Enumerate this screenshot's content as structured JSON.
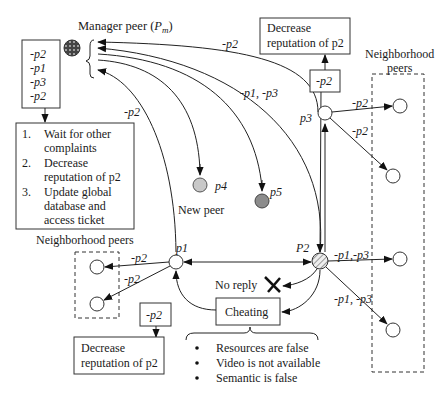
{
  "manager": {
    "label": "Manager peer (",
    "symbol": "P",
    "subscript": "m",
    "close": ")"
  },
  "complaint_queue": {
    "items": [
      "-p2",
      "-p1",
      "-p3",
      "-p2"
    ]
  },
  "manager_actions": {
    "items": [
      {
        "num": "1.",
        "lines": [
          "Wait for other",
          "complaints"
        ]
      },
      {
        "num": "2.",
        "lines": [
          "Decrease",
          "reputation of p2"
        ]
      },
      {
        "num": "3.",
        "lines": [
          "Update global",
          "database and",
          "access ticket"
        ]
      }
    ]
  },
  "edge_labels": {
    "p3_to_manager": "-p2",
    "p2_to_manager": "-p1, -p3",
    "p1_to_manager": "-p2",
    "p3_box": "-p2",
    "p3_n1": "-p2",
    "p3_n2": "-p2",
    "p2_n3": "-p1,-p3",
    "p2_n4": "-p1, -p3",
    "p1_n1": "-p2",
    "p1_n2": "-p2",
    "p1_box": "-p2"
  },
  "decrease_box_top": {
    "line1": "Decrease",
    "line2": "reputation of p2"
  },
  "decrease_box_bottom": {
    "line1": "Decrease",
    "line2": "reputation of p2"
  },
  "neighborhood_right": {
    "line1": "Neighborhood",
    "line2": "peers"
  },
  "neighborhood_left": {
    "label": "Neighborhood peers"
  },
  "nodes": {
    "p1": "p1",
    "p2": "P2",
    "p3": "p3",
    "p4": "p4",
    "p5": "p5"
  },
  "new_peer": "New peer",
  "no_reply": "No reply",
  "cheating": {
    "label": "Cheating",
    "reasons": [
      "Resources are false",
      "Video is not available",
      "Semantic is false"
    ]
  },
  "colors": {
    "manager_fill": "#555555",
    "p4_fill": "#c8c8c8",
    "p5_fill": "#8c8c8c",
    "p2_hatch": "#999999",
    "line": "#222222"
  }
}
